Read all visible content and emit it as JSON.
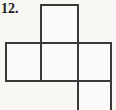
{
  "figure": {
    "label": "12.",
    "kind": "cube-net-diagram",
    "background_color": "#f8f7f4",
    "line_color": "#3a3a3a",
    "line_width": 2,
    "label_color": "#1c1c1c",
    "grid": {
      "x_positions": [
        6,
        41,
        78,
        111
      ],
      "y_positions": [
        5,
        43,
        81,
        110
      ]
    },
    "faces": [
      {
        "name": "top-square",
        "x1": 41,
        "y1": 5,
        "x2": 78,
        "y2": 43
      },
      {
        "name": "middle-left-square",
        "x1": 6,
        "y1": 43,
        "x2": 41,
        "y2": 81
      },
      {
        "name": "middle-center-square",
        "x1": 41,
        "y1": 43,
        "x2": 78,
        "y2": 81
      },
      {
        "name": "middle-right-square",
        "x1": 78,
        "y1": 43,
        "x2": 111,
        "y2": 81
      },
      {
        "name": "bottom-partial-square",
        "x1": 78,
        "y1": 81,
        "x2": 111,
        "y2": 110
      }
    ],
    "edges": [
      {
        "name": "top-square-top-edge",
        "x1": 41,
        "y1": 5,
        "x2": 78,
        "y2": 5
      },
      {
        "name": "top-square-left-edge",
        "x1": 41,
        "y1": 5,
        "x2": 41,
        "y2": 43
      },
      {
        "name": "top-square-right-edge",
        "x1": 78,
        "y1": 5,
        "x2": 78,
        "y2": 43
      },
      {
        "name": "middle-row-top-edge",
        "x1": 6,
        "y1": 43,
        "x2": 111,
        "y2": 43
      },
      {
        "name": "middle-row-bottom-edge",
        "x1": 6,
        "y1": 81,
        "x2": 111,
        "y2": 81
      },
      {
        "name": "middle-row-left-edge",
        "x1": 6,
        "y1": 43,
        "x2": 6,
        "y2": 81
      },
      {
        "name": "middle-divider-left",
        "x1": 41,
        "y1": 43,
        "x2": 41,
        "y2": 81
      },
      {
        "name": "middle-divider-right",
        "x1": 78,
        "y1": 43,
        "x2": 78,
        "y2": 81
      },
      {
        "name": "middle-row-right-edge",
        "x1": 111,
        "y1": 43,
        "x2": 111,
        "y2": 81
      },
      {
        "name": "bottom-square-left-edge",
        "x1": 78,
        "y1": 81,
        "x2": 78,
        "y2": 110
      },
      {
        "name": "bottom-square-right-edge",
        "x1": 111,
        "y1": 81,
        "x2": 111,
        "y2": 110
      }
    ]
  }
}
